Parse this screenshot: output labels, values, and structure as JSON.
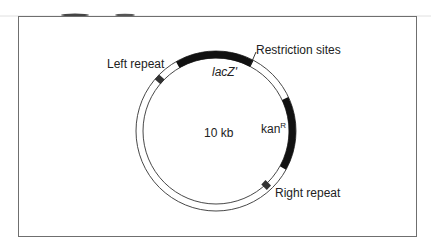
{
  "diagram": {
    "type": "plasmid-map",
    "center_label": "10 kb",
    "features": [
      {
        "id": "lacz",
        "label": "lacZ'",
        "italic": true,
        "start_deg": -30,
        "end_deg": 28,
        "style": "thick-black"
      },
      {
        "id": "kan",
        "label": "kan",
        "superscript": "R",
        "start_deg": 75,
        "end_deg": 118,
        "style": "thick-black"
      },
      {
        "id": "left-repeat",
        "label": "Left repeat",
        "at_deg": -52,
        "style": "small-box"
      },
      {
        "id": "right-repeat",
        "label": "Right repeat",
        "at_deg": 145,
        "style": "small-box"
      }
    ],
    "annotations": [
      {
        "id": "restriction-sites",
        "label": "Restriction sites"
      }
    ]
  }
}
